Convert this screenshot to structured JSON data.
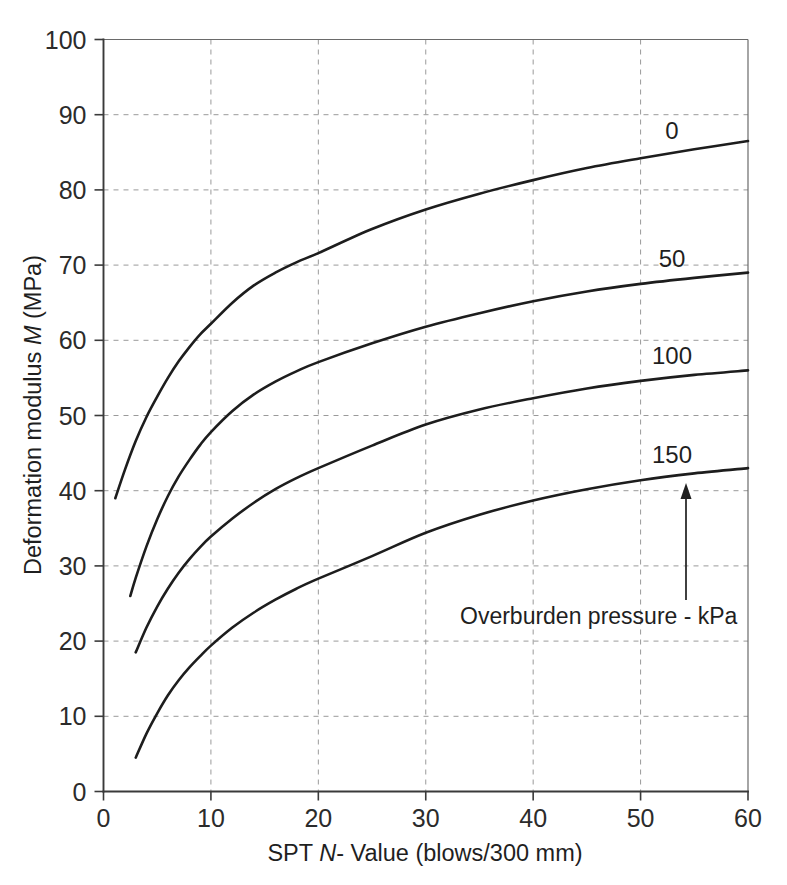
{
  "chart_data": {
    "type": "line",
    "title": "",
    "xlabel": "SPT N- Value (blows/300 mm)",
    "xlabel_parts": {
      "pre": "SPT ",
      "italic": "N",
      "post": "- Value (blows/300 mm)"
    },
    "ylabel": "Deformation modulus M (MPa)",
    "ylabel_parts": {
      "pre": "Deformation modulus ",
      "italic": "M",
      "post": " (MPa)"
    },
    "xlim": [
      0,
      60
    ],
    "ylim": [
      0,
      100
    ],
    "xticks": [
      0,
      10,
      20,
      30,
      40,
      50,
      60
    ],
    "yticks": [
      0,
      10,
      20,
      30,
      40,
      50,
      60,
      70,
      80,
      90,
      100
    ],
    "xticklabels": [
      "0",
      "10",
      "20",
      "30",
      "40",
      "50",
      "60"
    ],
    "yticklabels": [
      "0",
      "10",
      "20",
      "30",
      "40",
      "50",
      "60",
      "70",
      "80",
      "90",
      "100"
    ],
    "grid": true,
    "grid_style": "dashed",
    "legend": "inline-curve-labels",
    "legend_title": "Overburden pressure - kPa",
    "annotation": {
      "text": "Overburden pressure - kPa",
      "arrow": "up-arrow-to-curve-150"
    },
    "series": [
      {
        "name": "0",
        "label": "0",
        "units": "kPa",
        "x": [
          1.1,
          2,
          3,
          4,
          5,
          6,
          7,
          8,
          9,
          10,
          12,
          14,
          16,
          18,
          20,
          25,
          30,
          35,
          40,
          45,
          50,
          55,
          60
        ],
        "y": [
          39.0,
          42.8,
          46.6,
          49.8,
          52.5,
          55.0,
          57.2,
          59.1,
          60.8,
          62.2,
          65.0,
          67.3,
          69.0,
          70.4,
          71.6,
          74.8,
          77.4,
          79.5,
          81.3,
          82.9,
          84.2,
          85.4,
          86.5
        ]
      },
      {
        "name": "50",
        "label": "50",
        "units": "kPa",
        "x": [
          2.5,
          3,
          4,
          5,
          6,
          7,
          8,
          9,
          10,
          12,
          14,
          16,
          18,
          20,
          25,
          30,
          35,
          40,
          45,
          50,
          55,
          60
        ],
        "y": [
          26.0,
          28.4,
          32.6,
          36.2,
          39.3,
          41.9,
          44.1,
          46.1,
          47.8,
          50.6,
          52.8,
          54.5,
          55.9,
          57.1,
          59.6,
          61.8,
          63.6,
          65.2,
          66.5,
          67.5,
          68.3,
          69.0
        ]
      },
      {
        "name": "100",
        "label": "100",
        "units": "kPa",
        "x": [
          3,
          4,
          5,
          6,
          7,
          8,
          9,
          10,
          12,
          14,
          16,
          18,
          20,
          25,
          30,
          35,
          40,
          45,
          50,
          55,
          60
        ],
        "y": [
          18.5,
          21.8,
          24.6,
          27.0,
          29.1,
          30.9,
          32.5,
          33.9,
          36.3,
          38.4,
          40.2,
          41.7,
          43.0,
          46.0,
          48.8,
          50.8,
          52.3,
          53.6,
          54.6,
          55.4,
          56.0
        ]
      },
      {
        "name": "150",
        "label": "150",
        "units": "kPa",
        "x": [
          3,
          4,
          5,
          6,
          7,
          8,
          9,
          10,
          12,
          14,
          16,
          18,
          20,
          25,
          30,
          35,
          40,
          45,
          50,
          55,
          60
        ],
        "y": [
          4.5,
          7.7,
          10.4,
          12.8,
          14.8,
          16.5,
          18.0,
          19.4,
          21.8,
          23.8,
          25.5,
          27.0,
          28.3,
          31.3,
          34.4,
          36.8,
          38.7,
          40.2,
          41.4,
          42.3,
          43.0
        ]
      }
    ]
  },
  "colors": {
    "curve": "#1d1d1d",
    "grid": "#9a9a9a",
    "axis": "#3a3a3a",
    "text": "#1f1f1f",
    "background": "#ffffff"
  }
}
